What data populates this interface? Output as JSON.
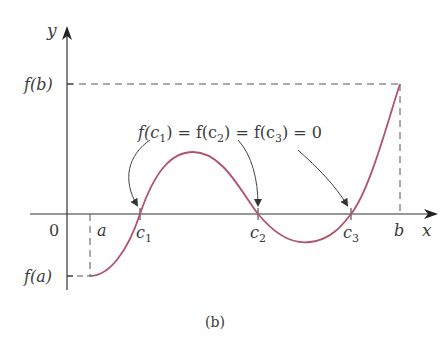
{
  "figure": {
    "caption": "(b)",
    "equation": "f(c₁) = f(c₂) = f(c₃) = 0",
    "equation_parts": {
      "f1": "f(c",
      "s1": "1",
      "eq1": ") = f(c",
      "s2": "2",
      "eq2": ") = f(c",
      "s3": "3",
      "eq3": ") = 0"
    },
    "axes": {
      "x_label": "x",
      "y_label": "y",
      "origin_label": "0"
    },
    "x_ticks": {
      "a": "a",
      "c1_base": "c",
      "c1_sub": "1",
      "c2_base": "c",
      "c2_sub": "2",
      "c3_base": "c",
      "c3_sub": "3",
      "b": "b"
    },
    "y_ticks": {
      "fb": "f(b)",
      "fa": "f(a)"
    },
    "colors": {
      "curve": "#b0536b",
      "axis": "#333333",
      "dashed": "#555555",
      "text": "#3a3a3a"
    }
  }
}
